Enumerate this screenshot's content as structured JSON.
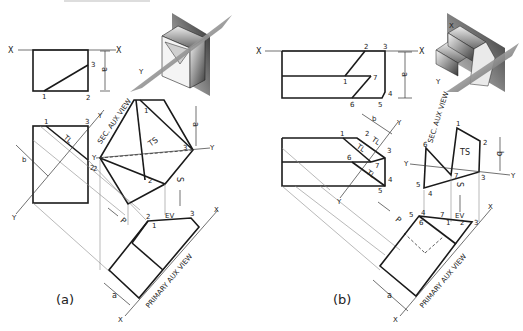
{
  "figure": {
    "panels": [
      {
        "caption": "(a)",
        "front_view": {
          "ref_line_left": "X",
          "ref_line_right": "X",
          "points": [
            "1",
            "2",
            "3"
          ],
          "dimension": "a"
        },
        "top_view": {
          "points": [
            "1",
            "3",
            "2"
          ],
          "true_length_label": "TL",
          "dimension": "b",
          "ref_line_label": "Y"
        },
        "secondary_aux_view": {
          "title": "SEC. AUX VIEW",
          "true_shape_label": "TS",
          "points": [
            "1",
            "2",
            "3"
          ],
          "ref_label_left": "Y",
          "ref_label_right": "Y",
          "ref_line_top": "Y",
          "dimension": "a",
          "sight_label": "S"
        },
        "primary_aux_view": {
          "title": "PRIMARY AUX VIEW",
          "edge_view_label": "EV",
          "points": [
            "1",
            "2",
            "3"
          ],
          "ref_label_top": "X",
          "ref_label_bottom": "X",
          "dimension": "a",
          "sight_label": "P"
        },
        "pictorial": {
          "plane_label": "Y"
        }
      },
      {
        "caption": "(b)",
        "front_view": {
          "ref_line_left": "X",
          "ref_line_right": "X",
          "points": [
            "1",
            "2",
            "3",
            "4",
            "5",
            "6",
            "7"
          ],
          "dimension": "a"
        },
        "top_view": {
          "points": [
            "1",
            "2",
            "3",
            "4",
            "5",
            "6",
            "7"
          ],
          "true_length_labels": [
            "TL",
            "TL",
            "TL"
          ],
          "dimension": "b",
          "ref_label_top": "Y",
          "ref_label_bottom": "Y"
        },
        "secondary_aux_view": {
          "title": "SEC. AUX VIEW",
          "true_shape_label": "TS",
          "points": [
            "1",
            "2",
            "3",
            "4",
            "5",
            "6",
            "7"
          ],
          "ref_label_left": "Y",
          "ref_label_right": "Y",
          "dimension": "b",
          "sight_label": "S"
        },
        "primary_aux_view": {
          "title": "PRIMARY AUX VIEW",
          "edge_view_label": "EV",
          "points": [
            "5",
            "4",
            "6",
            "7",
            "1",
            "2",
            "3"
          ],
          "ref_label_top": "X",
          "ref_label_bottom": "X",
          "dimension": "a",
          "sight_label": "P"
        },
        "pictorial": {
          "plane_label_x": "X",
          "plane_label_y": "Y"
        }
      }
    ]
  }
}
